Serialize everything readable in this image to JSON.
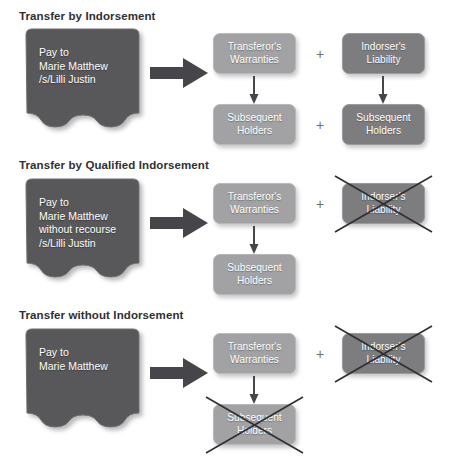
{
  "figure": {
    "colors": {
      "check_fill": "#58585a",
      "box_light": "#a2a2a4",
      "box_dark": "#7d7d80",
      "arrow": "#4a4a4c",
      "title_text": "#2f2f31",
      "box_text": "#ffffff",
      "x_mark": "#2f2f31",
      "background": "#ffffff"
    },
    "plus_symbol": "+"
  },
  "sections": [
    {
      "id": "transfer-by-indorsement",
      "title": "Transfer by Indorsement",
      "check": {
        "lines": [
          "Pay to",
          "Marie Matthew",
          "/s/Lilli Justin"
        ]
      },
      "boxes": {
        "transferors_warranties": {
          "line1": "Transferor's",
          "line2": "Warranties",
          "tone": "light",
          "crossed_out": false
        },
        "indorsers_liability": {
          "line1": "Indorser's",
          "line2": "Liability",
          "tone": "dark",
          "crossed_out": false
        },
        "subsequent_holders_left": {
          "line1": "Subsequent",
          "line2": "Holders",
          "tone": "light",
          "crossed_out": false
        },
        "subsequent_holders_right": {
          "line1": "Subsequent",
          "line2": "Holders",
          "tone": "dark",
          "crossed_out": false
        }
      }
    },
    {
      "id": "transfer-by-qualified-indorsement",
      "title": "Transfer by Qualified Indorsement",
      "check": {
        "lines": [
          "Pay to",
          "Marie Matthew",
          "without recourse",
          "/s/Lilli Justin"
        ]
      },
      "boxes": {
        "transferors_warranties": {
          "line1": "Transferor's",
          "line2": "Warranties",
          "tone": "light",
          "crossed_out": false
        },
        "indorsers_liability": {
          "line1": "Indorser's",
          "line2": "Liability",
          "tone": "dark",
          "crossed_out": true
        },
        "subsequent_holders_left": {
          "line1": "Subsequent",
          "line2": "Holders",
          "tone": "light",
          "crossed_out": false
        }
      }
    },
    {
      "id": "transfer-without-indorsement",
      "title": "Transfer without Indorsement",
      "check": {
        "lines": [
          "Pay to",
          "Marie Matthew"
        ]
      },
      "boxes": {
        "transferors_warranties": {
          "line1": "Transferor's",
          "line2": "Warranties",
          "tone": "light",
          "crossed_out": false
        },
        "indorsers_liability": {
          "line1": "Indorser's",
          "line2": "Liability",
          "tone": "dark",
          "crossed_out": true
        },
        "subsequent_holders_left": {
          "line1": "Subsequent",
          "line2": "Holders",
          "tone": "light",
          "crossed_out": true
        }
      }
    }
  ]
}
